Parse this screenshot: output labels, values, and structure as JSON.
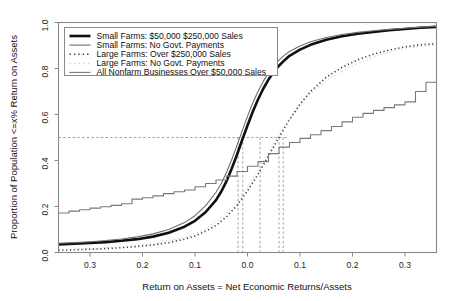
{
  "figure": {
    "background_color": "#ffffff",
    "frame_color": "#8a8a8a"
  },
  "axes": {
    "x": {
      "title": "Return on Assets = Net Economic Returns/Assets",
      "tick_labels": [
        "0.3",
        "0.2",
        "0.1",
        "0.0",
        "0.1",
        "0.2",
        "0.3"
      ],
      "tick_values": [
        -0.3,
        -0.2,
        -0.1,
        0.0,
        0.1,
        0.2,
        0.3
      ],
      "range": [
        -0.36,
        0.36
      ]
    },
    "y": {
      "title": "Proportion of Population <=x% Return on Assets",
      "tick_labels": [
        "0.0",
        "0.2",
        "0.4",
        "0.6",
        "0.8",
        "1.0"
      ],
      "tick_values": [
        0.0,
        0.2,
        0.4,
        0.6,
        0.8,
        1.0
      ],
      "range": [
        0.0,
        1.0
      ]
    }
  },
  "legend": {
    "position": "top-left",
    "entries": [
      {
        "label": "Small Farms: $50,000  $250,000 Sales",
        "style": "solid",
        "color": "#101010",
        "width": 2.6,
        "sample_name": "legend-sample-small-farms-sales"
      },
      {
        "label": "Small Farms: No Govt. Payments",
        "style": "solid",
        "color": "#6e6e6e",
        "width": 1.1,
        "sample_name": "legend-sample-small-farms-no-govt"
      },
      {
        "label": "Large Farms: Over $250,000 Sales",
        "style": "dotted",
        "color": "#3a3a3a",
        "width": 1.6,
        "sample_name": "legend-sample-large-farms-sales"
      },
      {
        "label": "Large Farms: No Govt. Payments",
        "style": "dotted-faint",
        "color": "#c4c4c4",
        "width": 1.0,
        "sample_name": "legend-sample-large-farms-no-govt"
      },
      {
        "label": "All Nonfarm Businesses Over $50,000 Sales",
        "style": "solid",
        "color": "#787878",
        "width": 1.1,
        "sample_name": "legend-sample-all-nonfarm"
      }
    ]
  },
  "reference_lines": {
    "horizontal": {
      "value": 0.5,
      "label": "median"
    },
    "vertical_values": [
      -0.018,
      -0.009,
      0.024,
      0.06,
      0.068
    ]
  },
  "chart_data": {
    "type": "line",
    "title": "",
    "xlabel": "Return on Assets = Net Economic Returns/Assets",
    "ylabel": "Proportion of Population <=x% Return on Assets",
    "xlim": [
      -0.36,
      0.36
    ],
    "ylim": [
      0.0,
      1.0
    ],
    "grid": false,
    "legend_position": "upper-left",
    "annotations": [
      "Dashed horizontal reference line at proportion = 0.5",
      "Five dashed vertical lines dropping from the 0.5 crossing of each curve"
    ],
    "series": [
      {
        "name": "Small Farms: $50,000  $250,000 Sales",
        "color": "#101010",
        "style": "solid",
        "width": 2.6,
        "x": [
          -0.36,
          -0.33,
          -0.3,
          -0.27,
          -0.24,
          -0.21,
          -0.18,
          -0.15,
          -0.12,
          -0.1,
          -0.08,
          -0.06,
          -0.05,
          -0.04,
          -0.03,
          -0.02,
          -0.01,
          0.0,
          0.01,
          0.02,
          0.03,
          0.04,
          0.05,
          0.06,
          0.07,
          0.08,
          0.1,
          0.12,
          0.15,
          0.18,
          0.21,
          0.24,
          0.27,
          0.3,
          0.33,
          0.36
        ],
        "y": [
          0.035,
          0.038,
          0.041,
          0.045,
          0.051,
          0.058,
          0.069,
          0.086,
          0.112,
          0.138,
          0.175,
          0.228,
          0.265,
          0.31,
          0.365,
          0.425,
          0.49,
          0.552,
          0.612,
          0.665,
          0.712,
          0.752,
          0.785,
          0.812,
          0.835,
          0.855,
          0.882,
          0.903,
          0.925,
          0.94,
          0.951,
          0.959,
          0.966,
          0.972,
          0.977,
          0.981
        ]
      },
      {
        "name": "Small Farms: No Govt. Payments",
        "color": "#6e6e6e",
        "style": "solid",
        "width": 1.1,
        "x": [
          -0.36,
          -0.33,
          -0.3,
          -0.27,
          -0.24,
          -0.21,
          -0.18,
          -0.15,
          -0.12,
          -0.1,
          -0.08,
          -0.06,
          -0.05,
          -0.04,
          -0.03,
          -0.02,
          -0.01,
          0.0,
          0.01,
          0.02,
          0.03,
          0.04,
          0.05,
          0.06,
          0.07,
          0.08,
          0.1,
          0.12,
          0.15,
          0.18,
          0.21,
          0.24,
          0.27,
          0.3,
          0.33,
          0.36
        ],
        "y": [
          0.04,
          0.043,
          0.047,
          0.052,
          0.059,
          0.068,
          0.081,
          0.1,
          0.13,
          0.16,
          0.203,
          0.262,
          0.3,
          0.348,
          0.404,
          0.466,
          0.53,
          0.592,
          0.65,
          0.7,
          0.744,
          0.781,
          0.812,
          0.836,
          0.857,
          0.874,
          0.898,
          0.916,
          0.935,
          0.948,
          0.957,
          0.964,
          0.97,
          0.975,
          0.98,
          0.984
        ]
      },
      {
        "name": "Large Farms: Over $250,000 Sales",
        "color": "#3a3a3a",
        "style": "dotted",
        "width": 1.6,
        "x": [
          -0.36,
          -0.33,
          -0.3,
          -0.27,
          -0.24,
          -0.21,
          -0.18,
          -0.15,
          -0.12,
          -0.1,
          -0.08,
          -0.06,
          -0.04,
          -0.02,
          0.0,
          0.02,
          0.03,
          0.04,
          0.05,
          0.06,
          0.07,
          0.08,
          0.1,
          0.12,
          0.15,
          0.18,
          0.21,
          0.24,
          0.27,
          0.3,
          0.33,
          0.36
        ],
        "y": [
          0.01,
          0.012,
          0.014,
          0.017,
          0.021,
          0.026,
          0.033,
          0.043,
          0.058,
          0.072,
          0.092,
          0.118,
          0.155,
          0.205,
          0.268,
          0.34,
          0.38,
          0.42,
          0.46,
          0.5,
          0.54,
          0.578,
          0.645,
          0.7,
          0.762,
          0.805,
          0.838,
          0.862,
          0.88,
          0.894,
          0.903,
          0.908
        ]
      },
      {
        "name": "Large Farms: No Govt. Payments",
        "color": "#c4c4c4",
        "style": "dotted-faint",
        "width": 1.0,
        "x": [
          -0.36,
          -0.3,
          -0.24,
          -0.18,
          -0.12,
          -0.08,
          -0.04,
          0.0,
          0.03,
          0.06,
          0.09,
          0.12,
          0.16,
          0.2,
          0.25,
          0.3,
          0.36
        ],
        "y": [
          0.012,
          0.017,
          0.025,
          0.038,
          0.066,
          0.102,
          0.17,
          0.285,
          0.395,
          0.515,
          0.61,
          0.69,
          0.762,
          0.812,
          0.858,
          0.888,
          0.902
        ]
      },
      {
        "name": "All Nonfarm Businesses Over $50,000 Sales",
        "color": "#787878",
        "style": "solid-step",
        "width": 1.1,
        "x": [
          -0.36,
          -0.34,
          -0.32,
          -0.3,
          -0.28,
          -0.26,
          -0.24,
          -0.22,
          -0.2,
          -0.18,
          -0.16,
          -0.14,
          -0.12,
          -0.1,
          -0.08,
          -0.06,
          -0.04,
          -0.02,
          0.0,
          0.02,
          0.04,
          0.06,
          0.08,
          0.1,
          0.12,
          0.14,
          0.16,
          0.18,
          0.2,
          0.22,
          0.24,
          0.26,
          0.28,
          0.3,
          0.32,
          0.34,
          0.36
        ],
        "y": [
          0.172,
          0.18,
          0.186,
          0.193,
          0.199,
          0.205,
          0.212,
          0.232,
          0.238,
          0.246,
          0.256,
          0.264,
          0.272,
          0.286,
          0.3,
          0.315,
          0.332,
          0.352,
          0.375,
          0.395,
          0.43,
          0.458,
          0.478,
          0.496,
          0.512,
          0.53,
          0.548,
          0.568,
          0.588,
          0.605,
          0.618,
          0.63,
          0.642,
          0.655,
          0.7,
          0.74,
          0.76
        ]
      }
    ]
  }
}
